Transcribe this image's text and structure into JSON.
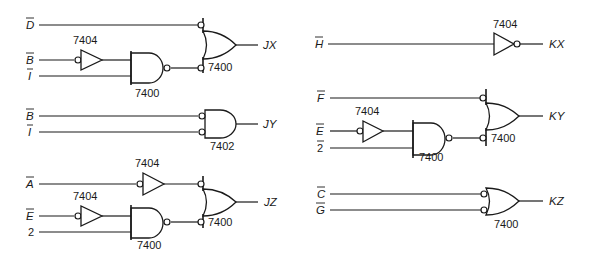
{
  "circuits": {
    "jx": {
      "inputs": [
        {
          "label": "D",
          "negated": true
        },
        {
          "label": "B",
          "negated": true
        },
        {
          "label": "I",
          "negated": true
        }
      ],
      "gates": [
        {
          "type": "buffer-inverting-input",
          "part": "7404"
        },
        {
          "type": "nand",
          "part": "7400"
        },
        {
          "type": "or-negated-inputs",
          "part": "7400"
        }
      ],
      "output": "JX"
    },
    "jy": {
      "inputs": [
        {
          "label": "B",
          "negated": true
        },
        {
          "label": "I",
          "negated": true
        }
      ],
      "gates": [
        {
          "type": "and-negated-inputs",
          "part": "7402"
        }
      ],
      "output": "JY"
    },
    "jz": {
      "inputs": [
        {
          "label": "A",
          "negated": true
        },
        {
          "label": "E",
          "negated": true
        },
        {
          "label": "2",
          "negated": false
        }
      ],
      "gates": [
        {
          "type": "buffer-inverting-input",
          "part": "7404"
        },
        {
          "type": "buffer-inverting-input",
          "part": "7404"
        },
        {
          "type": "nand",
          "part": "7400"
        },
        {
          "type": "or-negated-inputs",
          "part": "7400"
        }
      ],
      "output": "JZ"
    },
    "kx": {
      "inputs": [
        {
          "label": "H",
          "negated": true
        }
      ],
      "gates": [
        {
          "type": "inverter",
          "part": "7404"
        }
      ],
      "output": "KX"
    },
    "ky": {
      "inputs": [
        {
          "label": "F",
          "negated": true
        },
        {
          "label": "E",
          "negated": true
        },
        {
          "label": "2",
          "negated": true
        }
      ],
      "gates": [
        {
          "type": "buffer-inverting-input",
          "part": "7404"
        },
        {
          "type": "nand",
          "part": "7400"
        },
        {
          "type": "or-negated-inputs",
          "part": "7400"
        }
      ],
      "output": "KY"
    },
    "kz": {
      "inputs": [
        {
          "label": "C",
          "negated": true
        },
        {
          "label": "G",
          "negated": true
        }
      ],
      "gates": [
        {
          "type": "or-negated-inputs",
          "part": "7400"
        }
      ],
      "output": "KZ"
    }
  }
}
